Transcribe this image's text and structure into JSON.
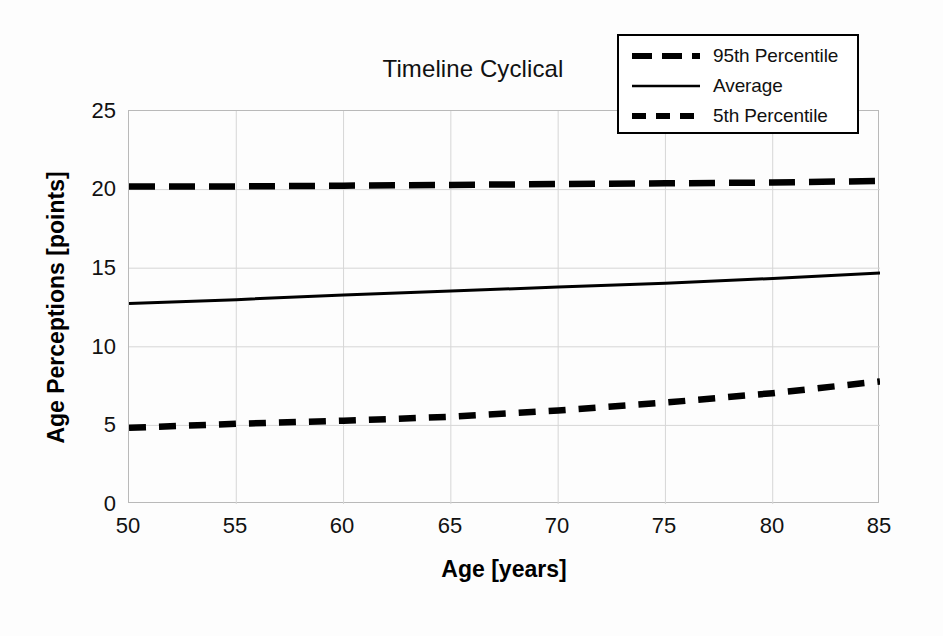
{
  "chart_data": {
    "type": "line",
    "title": "Timeline Cyclical",
    "xlabel": "Age [years]",
    "ylabel": "Age Perceptions [points]",
    "xlim": [
      50,
      85
    ],
    "ylim": [
      0,
      25
    ],
    "xticks": [
      50,
      55,
      60,
      65,
      70,
      75,
      80,
      85
    ],
    "yticks": [
      0,
      5,
      10,
      15,
      20,
      25
    ],
    "grid": true,
    "legend_position": "top-right",
    "x": [
      50,
      55,
      60,
      65,
      70,
      75,
      80,
      85
    ],
    "series": [
      {
        "name": "95th Percentile",
        "style": "long-dashed",
        "color": "#000000",
        "values": [
          20.2,
          20.2,
          20.25,
          20.3,
          20.35,
          20.4,
          20.45,
          20.55
        ]
      },
      {
        "name": "Average",
        "style": "solid",
        "color": "#000000",
        "values": [
          12.75,
          13.0,
          13.3,
          13.55,
          13.8,
          14.05,
          14.35,
          14.7
        ]
      },
      {
        "name": "5th Percentile",
        "style": "short-dashed",
        "color": "#000000",
        "values": [
          4.85,
          5.1,
          5.3,
          5.55,
          5.95,
          6.45,
          7.05,
          7.8
        ]
      }
    ]
  },
  "legend": {
    "entries": [
      {
        "label": "95th Percentile",
        "key": "long-dash-key-icon"
      },
      {
        "label": "Average",
        "key": "solid-line-key-icon"
      },
      {
        "label": "5th Percentile",
        "key": "short-dash-key-icon"
      }
    ]
  },
  "axis": {
    "ytick_labels": [
      "25",
      "20",
      "15",
      "10",
      "5",
      "0"
    ],
    "xtick_labels": [
      "50",
      "55",
      "60",
      "65",
      "70",
      "75",
      "80",
      "85"
    ]
  },
  "colors": {
    "line": "#000000",
    "grid": "#d6d6d6",
    "frame": "#b9b9b9",
    "background": "#ffffff",
    "text": "#111111"
  }
}
